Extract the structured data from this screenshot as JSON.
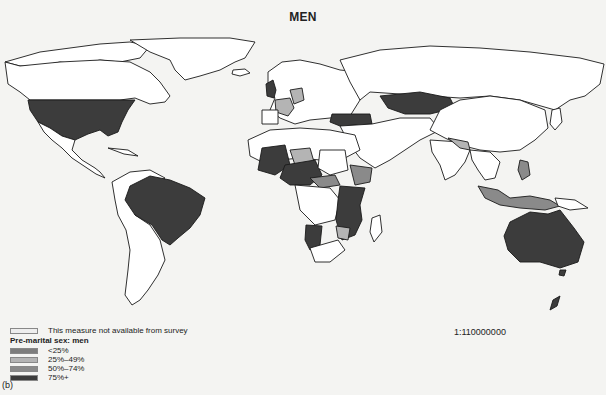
{
  "title": "MEN",
  "scale": "1:110000000",
  "panel_label": "(b)",
  "legend": {
    "na_label": "This measure not available from survey",
    "title": "Pre-marital sex: men",
    "items": [
      {
        "label": "<25%",
        "color": "#7d7d7d"
      },
      {
        "label": "25%–49%",
        "color": "#b4b4b4"
      },
      {
        "label": "50%–74%",
        "color": "#8a8a8a"
      },
      {
        "label": "75%+",
        "color": "#3c3c3c"
      }
    ],
    "na_color": "#ffffff"
  },
  "map": {
    "projection": "world",
    "category_75_plus": [
      "United States",
      "Brazil",
      "Kazakhstan",
      "Turkey",
      "Australia",
      "Mali",
      "Burkina Faso",
      "Nigeria",
      "Cameroon",
      "Chad (south)",
      "Uganda",
      "Tanzania",
      "Kenya",
      "Mozambique",
      "Zambia",
      "Namibia",
      "Zimbabwe",
      "United Kingdom",
      "New Zealand"
    ],
    "category_50_74": [
      "Ethiopia",
      "Central African Republic",
      "Indonesia",
      "Philippines",
      "Senegal"
    ],
    "category_25_49": [
      "France",
      "Germany",
      "Niger",
      "Nepal",
      "Bangladesh",
      "Malawi"
    ],
    "category_lt25": []
  }
}
